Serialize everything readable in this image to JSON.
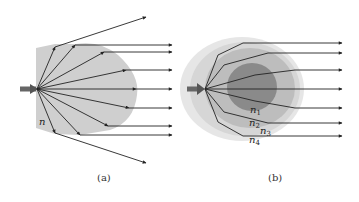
{
  "figure": {
    "panels": [
      {
        "id": "a",
        "caption": "(a)",
        "region_label": "n",
        "description": "Point source with rays refracted at a single uniform-index boundary; outer rays diverge"
      },
      {
        "id": "b",
        "caption": "(b)",
        "layer_labels": [
          "n",
          "n",
          "n",
          "n"
        ],
        "layer_subscripts": [
          "1",
          "2",
          "3",
          "4"
        ],
        "description": "Point source with rays bent through graded layered index regions, emerging parallel"
      }
    ],
    "colors": {
      "region_a": "#cfcfcf",
      "layer_n4": "#e6e6e6",
      "layer_n3": "#d6d6d6",
      "layer_n2": "#bdbdbd",
      "layer_n1": "#8a8a8a",
      "ray": "#222222",
      "source": "#666666"
    }
  }
}
